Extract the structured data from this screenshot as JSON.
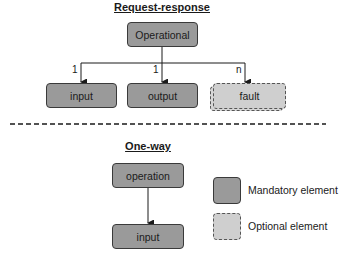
{
  "request_response": {
    "title": "Request-response",
    "root": "Operational",
    "children": [
      {
        "label": "input",
        "multiplicity": "1",
        "kind": "mandatory"
      },
      {
        "label": "output",
        "multiplicity": "1",
        "kind": "mandatory"
      },
      {
        "label": "fault",
        "multiplicity": "n",
        "kind": "optional"
      }
    ]
  },
  "one_way": {
    "title": "One-way",
    "root": "operation",
    "child": "input"
  },
  "legend": {
    "mandatory": "Mandatory element",
    "optional": "Optional element"
  },
  "colors": {
    "mandatory_fill": "#9a9a9a",
    "optional_fill": "#cfcfcf",
    "stroke": "#3a3a3a"
  }
}
